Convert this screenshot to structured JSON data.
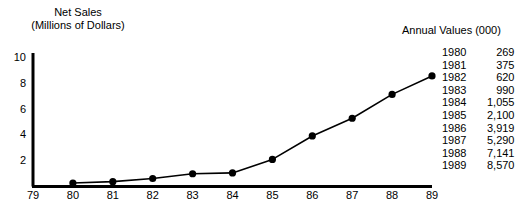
{
  "chart_data": {
    "type": "line",
    "title": "Net Sales",
    "subtitle": "(Millions of Dollars)",
    "xlabel": "",
    "ylabel": "",
    "x": [
      79,
      80,
      81,
      82,
      83,
      84,
      85,
      86,
      87,
      88,
      89
    ],
    "xtick_labels": [
      "79",
      "80",
      "81",
      "82",
      "83",
      "84",
      "85",
      "86",
      "87",
      "88",
      "89"
    ],
    "ytick_labels": [
      "2",
      "4",
      "6",
      "8",
      "10"
    ],
    "ytick_values": [
      2,
      4,
      6,
      8,
      10
    ],
    "xlim": [
      79,
      89
    ],
    "ylim": [
      0,
      10.8
    ],
    "grid": false,
    "legend": null,
    "series": [
      {
        "name": "Net Sales",
        "x": [
          80,
          81,
          82,
          83,
          84,
          85,
          86,
          87,
          88,
          89
        ],
        "values": [
          0.269,
          0.375,
          0.62,
          0.99,
          1.055,
          2.1,
          3.919,
          5.29,
          7.141,
          8.57
        ],
        "color": "#000000",
        "marker": "circle"
      }
    ],
    "table": {
      "heading": "Annual Values (000)",
      "columns": [
        "Year",
        "Value"
      ],
      "rows": [
        {
          "year": "1980",
          "value": "269"
        },
        {
          "year": "1981",
          "value": "375"
        },
        {
          "year": "1982",
          "value": "620"
        },
        {
          "year": "1983",
          "value": "990"
        },
        {
          "year": "1984",
          "value": "1,055"
        },
        {
          "year": "1985",
          "value": "2,100"
        },
        {
          "year": "1986",
          "value": "3,919"
        },
        {
          "year": "1987",
          "value": "5,290"
        },
        {
          "year": "1988",
          "value": "7,141"
        },
        {
          "year": "1989",
          "value": "8,570"
        }
      ]
    }
  }
}
